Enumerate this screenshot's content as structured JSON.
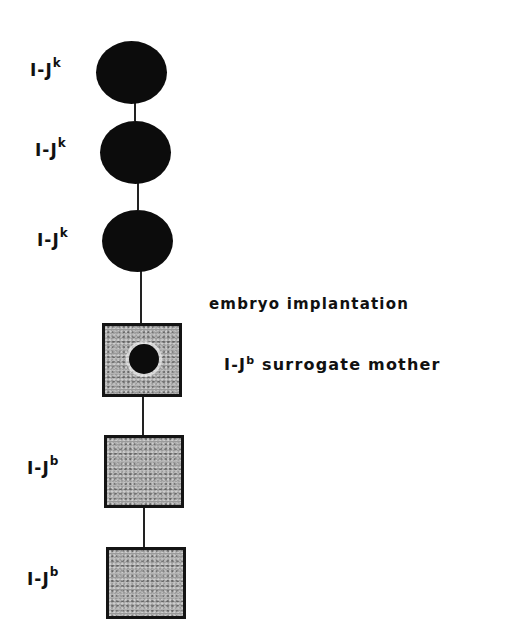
{
  "diagram": {
    "type": "pedigree",
    "nodes": [
      {
        "shape": "circle",
        "fill": "black",
        "label_base": "I-J",
        "label_sup": "k"
      },
      {
        "shape": "circle",
        "fill": "black",
        "label_base": "I-J",
        "label_sup": "k"
      },
      {
        "shape": "circle",
        "fill": "black",
        "label_base": "I-J",
        "label_sup": "k"
      },
      {
        "shape": "square",
        "fill": "stippled-gray",
        "inner": "black-embryo-circle",
        "label_base": "",
        "label_sup": ""
      },
      {
        "shape": "square",
        "fill": "stippled-gray",
        "label_base": "I-J",
        "label_sup": "b"
      },
      {
        "shape": "square",
        "fill": "stippled-gray",
        "label_base": "I-J",
        "label_sup": "b"
      }
    ],
    "annotations": {
      "implantation": "embryo implantation",
      "surrogate_base": "I-J",
      "surrogate_sup": "b",
      "surrogate_rest": " surrogate mother"
    },
    "colors": {
      "filled": "#0c0c0c",
      "stipple": "#9a9a9a",
      "line": "#222222"
    }
  }
}
